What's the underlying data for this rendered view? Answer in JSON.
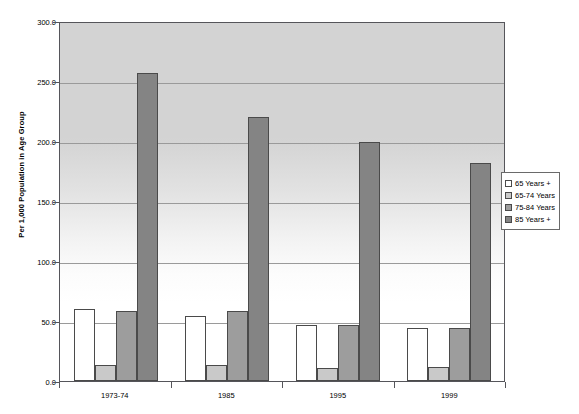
{
  "chart_data": {
    "type": "bar",
    "title": "",
    "subtitle": "",
    "xlabel": "",
    "ylabel": "Per 1,000 Population in Age Group",
    "categories": [
      "1973-74",
      "1985",
      "1995",
      "1999"
    ],
    "series": [
      {
        "name": "65 Years +",
        "values": [
          60.0,
          54.0,
          47.0,
          44.5
        ],
        "color": "#ffffff"
      },
      {
        "name": "65-74 Years",
        "values": [
          13.0,
          13.5,
          10.5,
          12.0
        ],
        "color": "#c9c9c9"
      },
      {
        "name": "75-84 Years",
        "values": [
          58.0,
          58.0,
          47.0,
          44.5
        ],
        "color": "#9d9d9d"
      },
      {
        "name": "85 Years +",
        "values": [
          257.0,
          220.0,
          199.0,
          182.0
        ],
        "color": "#848484"
      }
    ],
    "ylim": [
      0.0,
      300.0
    ],
    "ytick_step": 50.0,
    "ytick_labels": [
      "300.0",
      "250.0",
      "200.0",
      "150.0",
      "100.0",
      "50.0",
      "0.0"
    ],
    "ytick_values": [
      300.0,
      250.0,
      200.0,
      150.0,
      100.0,
      50.0,
      0.0
    ],
    "grid": true,
    "grid_axis": "y",
    "legend_position": "right",
    "plot_background": "gradient-gray-to-white",
    "frame_color": "#55555a"
  },
  "legend": {
    "items": [
      {
        "label": "65 Years +"
      },
      {
        "label": "65-74 Years"
      },
      {
        "label": "75-84 Years"
      },
      {
        "label": "85 Years +"
      }
    ]
  }
}
